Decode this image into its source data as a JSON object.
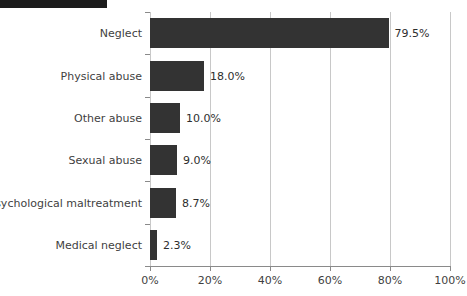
{
  "header": {
    "strip_color": "#1c1c1c"
  },
  "chart_data": {
    "type": "bar",
    "orientation": "horizontal",
    "title": "",
    "subtitle": "",
    "xlabel": "",
    "ylabel": "",
    "categories": [
      "Neglect",
      "Physical abuse",
      "Other abuse",
      "Sexual abuse",
      "Psychological maltreatment",
      "Medical neglect"
    ],
    "values": [
      79.5,
      18.0,
      10.0,
      9.0,
      8.7,
      2.3
    ],
    "value_labels": [
      "79.5%",
      "18.0%",
      "10.0%",
      "9.0%",
      "8.7%",
      "2.3%"
    ],
    "xlim": [
      0,
      100
    ],
    "xticks": [
      0,
      20,
      40,
      60,
      80,
      100
    ],
    "xtick_labels": [
      "0%",
      "20%",
      "40%",
      "60%",
      "80%",
      "100%"
    ],
    "grid": true,
    "grid_axis": "x",
    "legend": false,
    "bar_color": "#333333",
    "grid_color": "#c8c8c8",
    "axis_color": "#8a8a8a"
  }
}
